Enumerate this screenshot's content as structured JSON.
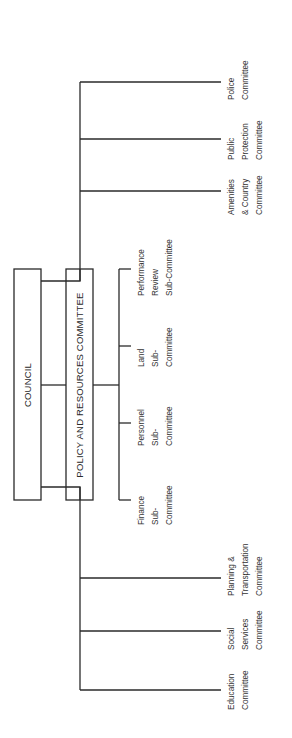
{
  "diagram": {
    "orientation": "rotated-90-ccw",
    "line_color": "#2a2a2a",
    "text_color": "#333333",
    "council": {
      "label": "COUNCIL"
    },
    "policy_resources": {
      "label": "POLICY AND RESOURCES COMMITTEE"
    },
    "sub_committees": [
      {
        "lines": [
          "Finance",
          "Sub-",
          "Committee"
        ]
      },
      {
        "lines": [
          "Personnel",
          "Sub-",
          "Committee"
        ]
      },
      {
        "lines": [
          "Land",
          "Sub-",
          "Committee"
        ]
      },
      {
        "lines": [
          "Performance",
          "Review",
          "Sub-Committee"
        ]
      }
    ],
    "committees": [
      {
        "lines": [
          "Education",
          "Committee"
        ]
      },
      {
        "lines": [
          "Social",
          "Services",
          "Committee"
        ]
      },
      {
        "lines": [
          "Planning &",
          "Transportation",
          "Committee"
        ]
      },
      {
        "lines": [
          "Amenities",
          "& Country",
          "Committee"
        ]
      },
      {
        "lines": [
          "Public",
          "Protection",
          "Committee"
        ]
      },
      {
        "lines": [
          "Police",
          "Committee"
        ]
      }
    ]
  }
}
